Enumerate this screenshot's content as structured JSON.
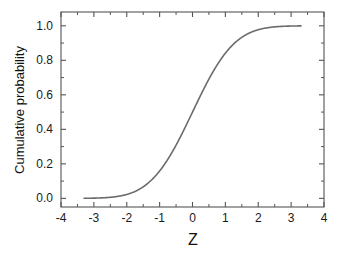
{
  "chart_data": {
    "type": "line",
    "title": "",
    "subtitle": "",
    "xlabel": "Z",
    "ylabel": "Cumulative probability",
    "xlim": [
      -4,
      4
    ],
    "ylim": [
      -0.05,
      1.08
    ],
    "grid": false,
    "legend": false,
    "legend_position": "none",
    "x_ticks": [
      -4,
      -3,
      -2,
      -1,
      0,
      1,
      2,
      3,
      4
    ],
    "x_tick_labels": [
      "-4",
      "-3",
      "-2",
      "-1",
      "0",
      "1",
      "2",
      "3",
      "4"
    ],
    "x_minor_ticks": [
      -3.5,
      -2.5,
      -1.5,
      -0.5,
      0.5,
      1.5,
      2.5,
      3.5
    ],
    "y_ticks": [
      0.0,
      0.2,
      0.4,
      0.6,
      0.8,
      1.0
    ],
    "y_tick_labels": [
      "0.0",
      "0.2",
      "0.4",
      "0.6",
      "0.8",
      "1.0"
    ],
    "y_minor_ticks": [
      0.1,
      0.3,
      0.5,
      0.7,
      0.9
    ],
    "tick_direction": "in",
    "frame": "full",
    "series": [
      {
        "name": "Standard normal cumulative probability",
        "color": "#6b6b6b",
        "line_width": 1.6,
        "x_range": [
          -3.3,
          3.3
        ],
        "x": [
          -3.3,
          -3.1,
          -2.9,
          -2.7,
          -2.5,
          -2.3,
          -2.1,
          -1.9,
          -1.7,
          -1.5,
          -1.3,
          -1.1,
          -0.9,
          -0.7,
          -0.5,
          -0.3,
          -0.1,
          0.1,
          0.3,
          0.5,
          0.7,
          0.9,
          1.1,
          1.3,
          1.5,
          1.7,
          1.9,
          2.1,
          2.3,
          2.5,
          2.7,
          2.9,
          3.1,
          3.3
        ],
        "values": [
          0.0005,
          0.001,
          0.0019,
          0.0035,
          0.0062,
          0.0107,
          0.0179,
          0.0287,
          0.0446,
          0.0668,
          0.0968,
          0.1357,
          0.1841,
          0.242,
          0.3085,
          0.3821,
          0.4602,
          0.5398,
          0.6179,
          0.6915,
          0.758,
          0.8159,
          0.8643,
          0.9032,
          0.9332,
          0.9554,
          0.9713,
          0.9821,
          0.9893,
          0.9938,
          0.9965,
          0.9981,
          0.999,
          0.9995
        ]
      }
    ],
    "axis_color": "#555555",
    "text_color": "#1a1a1a",
    "background": "#ffffff"
  },
  "figure": {
    "background": "#ffffff",
    "axis_color": "#555555"
  }
}
